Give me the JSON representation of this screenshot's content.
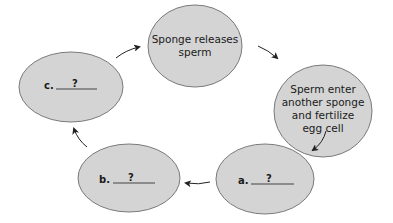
{
  "diagram": {
    "type": "cycle",
    "colors": {
      "node_fill": "#d4d4d4",
      "node_stroke": "#7a7a7a",
      "arrow": "#222222",
      "text": "#1a1a1a"
    },
    "nodes": [
      {
        "id": "top",
        "lines": [
          "Sponge releases",
          "sperm"
        ]
      },
      {
        "id": "right",
        "lines": [
          "Sperm enter",
          "another sponge",
          "and fertilize",
          "egg cell"
        ]
      },
      {
        "id": "a",
        "prefix": "a.",
        "blank": "?"
      },
      {
        "id": "b",
        "prefix": "b.",
        "blank": "?"
      },
      {
        "id": "c",
        "prefix": "c.",
        "blank": "?"
      }
    ],
    "edges": [
      {
        "from": "c",
        "to": "top"
      },
      {
        "from": "top",
        "to": "right"
      },
      {
        "from": "right",
        "to": "a"
      },
      {
        "from": "a",
        "to": "b"
      },
      {
        "from": "b",
        "to": "c"
      }
    ]
  }
}
